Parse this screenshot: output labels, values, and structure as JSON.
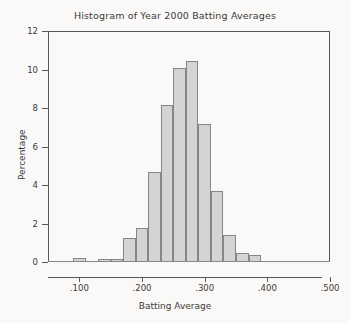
{
  "chart_data": {
    "type": "bar",
    "title": "Histogram of Year 2000 Batting Averages",
    "xlabel": "Batting Average",
    "ylabel": "Percentage",
    "grid": false,
    "legend": "none",
    "xlim": [
      0.05,
      0.5
    ],
    "ylim": [
      0,
      12
    ],
    "xticks": [
      ".100",
      ".200",
      ".300",
      ".400",
      ".500"
    ],
    "xtick_values": [
      0.1,
      0.2,
      0.3,
      0.4,
      0.5
    ],
    "yticks": [
      "0",
      "2",
      "4",
      "6",
      "8",
      "10",
      "12"
    ],
    "ytick_values": [
      0,
      2,
      4,
      6,
      8,
      10,
      12
    ],
    "bin_width": 0.02,
    "bin_starts": [
      0.09,
      0.11,
      0.13,
      0.15,
      0.17,
      0.19,
      0.21,
      0.23,
      0.25,
      0.27,
      0.29,
      0.31,
      0.33,
      0.35,
      0.37
    ],
    "categories": [
      ".090",
      ".110",
      ".130",
      ".150",
      ".170",
      ".190",
      ".210",
      ".230",
      ".250",
      ".270",
      ".290",
      ".310",
      ".330",
      ".350",
      ".370"
    ],
    "values": [
      0.2,
      0,
      0.15,
      0.15,
      1.25,
      1.75,
      4.7,
      8.15,
      10.1,
      10.45,
      7.15,
      3.7,
      1.4,
      0.45,
      0.35
    ],
    "bar_fill_color": "#d4d4d2",
    "bar_border_color": "#83868a",
    "axis_color": "#55585c",
    "background_color": "#faf9f7"
  }
}
